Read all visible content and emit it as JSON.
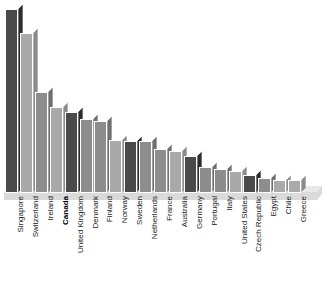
{
  "chart_data": {
    "type": "bar",
    "title": "",
    "subtitle": "",
    "xlabel": "",
    "ylabel": "",
    "grid": false,
    "legend": "none",
    "ylim": [
      0,
      100
    ],
    "categories": [
      "Singapore",
      "Switzerland",
      "Ireland",
      "Canada",
      "United Kingdom",
      "Denmark",
      "Finland",
      "Norway",
      "Sweden",
      "Netherlands",
      "France",
      "Australia",
      "Germany",
      "Portugal",
      "Italy",
      "United States",
      "Czech Republic",
      "Egypt",
      "Chile",
      "Greece"
    ],
    "values": [
      100,
      87,
      55,
      47,
      44,
      40,
      39,
      29,
      28,
      28,
      24,
      23,
      20,
      14,
      13,
      12,
      10,
      8,
      7,
      7
    ],
    "highlight_category": "Canada",
    "colors": {
      "accent_dark": "#4a4a4a",
      "bar_medium": "#8d8d8d",
      "bar_light": "#a9a9a9",
      "top_face": "#c9c9c9",
      "side_face": "#6f6f6f",
      "base_slab": "#d8d8d8",
      "background": "#ffffff",
      "label_text": "#1a1a1a"
    },
    "bar_styles": [
      "dark",
      "light",
      "medium",
      "light",
      "dark",
      "medium",
      "medium",
      "light",
      "dark",
      "medium",
      "medium",
      "light",
      "dark",
      "medium",
      "medium",
      "light",
      "dark",
      "medium",
      "light",
      "light"
    ]
  }
}
